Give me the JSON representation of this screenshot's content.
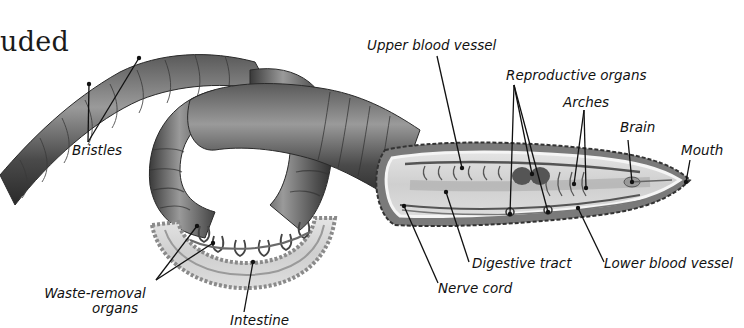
{
  "heading_fragment": "uded",
  "labels": {
    "upper_blood_vessel": "Upper blood vessel",
    "reproductive_organs": "Reproductive organs",
    "arches": "Arches",
    "brain": "Brain",
    "mouth": "Mouth",
    "bristles": "Bristles",
    "digestive_tract": "Digestive tract",
    "lower_blood_vessel": "Lower blood vessel",
    "nerve_cord": "Nerve cord",
    "waste_removal_line1": "Waste-removal",
    "waste_removal_line2": "organs",
    "intestine": "Intestine"
  },
  "colors": {
    "body_dark": "#3a3a3a",
    "body_mid": "#6e6e6e",
    "body_light": "#a8a8a8",
    "cutaway_fill": "#d9d9d9",
    "cutaway_border": "#f2f2f2",
    "leader_line": "#111111"
  }
}
